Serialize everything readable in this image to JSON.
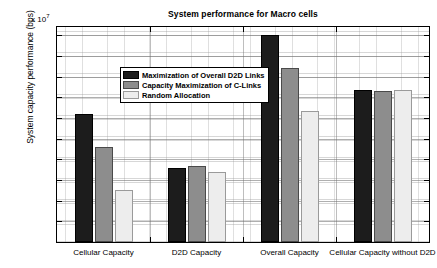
{
  "chart_data": {
    "type": "bar",
    "title": "System performance for Macro cells",
    "xlabel": "",
    "ylabel": "System capacity performance (bps)",
    "y_exponent_label": "x 10",
    "y_exponent_value": "7",
    "ylim": [
      0,
      5.2
    ],
    "yticks": [
      "0.5",
      "1",
      "1.5",
      "2",
      "2.5",
      "3",
      "3.5",
      "4",
      "4.5",
      "5"
    ],
    "ytick_values": [
      0.5,
      1,
      1.5,
      2,
      2.5,
      3,
      3.5,
      4,
      4.5,
      5
    ],
    "grid": true,
    "grid_minor": true,
    "legend_position": "upper left",
    "categories": [
      "Cellular Capacity",
      "D2D Capacity",
      "Overall Capacity",
      "Cellular Capacity without D2D"
    ],
    "series": [
      {
        "name": "Maximization of Overall D2D Links",
        "color": "#1c1c1c",
        "values": [
          3.1,
          1.8,
          5.01,
          3.67
        ]
      },
      {
        "name": "Capacity Maximization of C-Links",
        "color": "#8d8d8d",
        "values": [
          2.3,
          1.85,
          4.2,
          3.66
        ]
      },
      {
        "name": "Random Allocation",
        "color": "#ededed",
        "values": [
          1.27,
          1.7,
          3.16,
          3.67
        ]
      }
    ]
  }
}
